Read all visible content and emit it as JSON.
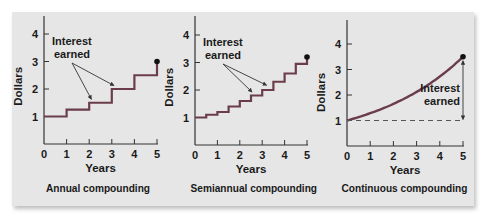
{
  "figure": {
    "panel_color": "#e6e6e6",
    "line_color": "#6b3d4a",
    "axis_color": "#333333",
    "text_color": "#1a1a1a"
  },
  "chart_data": [
    {
      "type": "line",
      "subtype": "step",
      "title": "Annual compounding",
      "xlabel": "Years",
      "ylabel": "Dollars",
      "x_ticks": [
        0,
        1,
        2,
        3,
        4,
        5
      ],
      "y_ticks": [
        1,
        2,
        3,
        4
      ],
      "xlim": [
        0,
        5
      ],
      "ylim": [
        0,
        4.8
      ],
      "series": [
        {
          "name": "Balance",
          "x": [
            0,
            1,
            2,
            3,
            4,
            5
          ],
          "values": [
            1.0,
            1.25,
            1.5,
            2.0,
            2.5,
            3.0
          ]
        }
      ],
      "endpoint": {
        "x": 5,
        "y": 3.0
      },
      "annotations": [
        {
          "text": "Interest earned",
          "lines": [
            "Interest",
            "earned"
          ],
          "arrows_to": [
            {
              "x": 2.1,
              "y": 1.55
            },
            {
              "x": 3.1,
              "y": 2.05
            }
          ]
        }
      ],
      "grid": false
    },
    {
      "type": "line",
      "subtype": "step",
      "title": "Semiannual compounding",
      "xlabel": "Years",
      "ylabel": "Dollars",
      "x_ticks": [
        0,
        1,
        2,
        3,
        4,
        5
      ],
      "y_ticks": [
        1,
        2,
        3,
        4
      ],
      "xlim": [
        0,
        5
      ],
      "ylim": [
        0,
        4.8
      ],
      "series": [
        {
          "name": "Balance",
          "x": [
            0,
            0.5,
            1,
            1.5,
            2,
            2.5,
            3,
            3.5,
            4,
            4.5,
            5
          ],
          "values": [
            1.0,
            1.1,
            1.2,
            1.4,
            1.6,
            1.8,
            2.0,
            2.3,
            2.6,
            2.95,
            3.2
          ]
        }
      ],
      "endpoint": {
        "x": 5,
        "y": 3.2
      },
      "annotations": [
        {
          "text": "Interest earned",
          "lines": [
            "Interest",
            "earned"
          ],
          "arrows_to": [
            {
              "x": 2.55,
              "y": 1.85
            },
            {
              "x": 3.2,
              "y": 2.1
            }
          ]
        }
      ],
      "grid": false
    },
    {
      "type": "line",
      "subtype": "curve",
      "title": "Continuous compounding",
      "xlabel": "Years",
      "ylabel": "Dollars",
      "x_ticks": [
        0,
        1,
        2,
        3,
        4,
        5
      ],
      "y_ticks": [
        1,
        2,
        3,
        4
      ],
      "xlim": [
        0,
        5
      ],
      "ylim": [
        0,
        4.8
      ],
      "series": [
        {
          "name": "Balance",
          "x": [
            0,
            1,
            2,
            3,
            4,
            5
          ],
          "values": [
            1.0,
            1.28,
            1.65,
            2.1,
            2.72,
            3.5
          ]
        }
      ],
      "baseline": {
        "y": 1.0,
        "style": "dashed"
      },
      "endpoint": {
        "x": 5,
        "y": 3.5
      },
      "annotations": [
        {
          "text": "Interest earned",
          "lines": [
            "Interest",
            "earned"
          ],
          "double_arrow": {
            "x": 5,
            "from": 1.0,
            "to": 3.5
          }
        }
      ],
      "grid": false
    }
  ],
  "layout": [
    {
      "x0": 44,
      "x1": 157,
      "yBase": 144,
      "yTop": 16,
      "pxPerY": 27.5,
      "label_x": 98
    },
    {
      "x0": 195,
      "x1": 307,
      "yBase": 145,
      "yTop": 16,
      "pxPerY": 27.5,
      "label_x": 252
    },
    {
      "x0": 347,
      "x1": 463,
      "yBase": 146,
      "yTop": 20,
      "pxPerY": 25.5,
      "label_x": 405
    }
  ]
}
